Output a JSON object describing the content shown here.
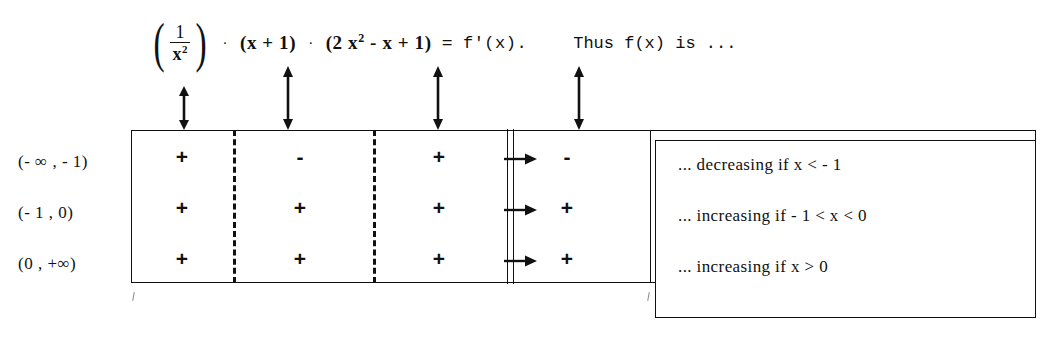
{
  "formula": {
    "fraction": {
      "numerator": "1",
      "denominator_base": "x",
      "denominator_exp": "2"
    },
    "dot1": "·",
    "factor1": "(x + 1)",
    "dot2": "·",
    "factor2_pre": "(2 x",
    "factor2_exp": "2",
    "factor2_post": " - x + 1)",
    "equals": "=",
    "derivative": "f'(x).",
    "thus": "Thus  f(x)  is ..."
  },
  "arrows": {
    "column_pointer_label": "double-headed-arrow",
    "row_pointer_label": "right-arrow"
  },
  "table": {
    "row_labels": [
      "(- ∞ , - 1)",
      "(- 1 , 0)",
      "(0 , +∞)"
    ],
    "column_signs": [
      [
        "+",
        "-",
        "+",
        "-"
      ],
      [
        "+",
        "+",
        "+",
        "+"
      ],
      [
        "+",
        "+",
        "+",
        "+"
      ]
    ]
  },
  "conclusion": {
    "lines": [
      "... decreasing if   x < - 1",
      "... increasing if   - 1 < x < 0",
      "... increasing if   x > 0"
    ]
  }
}
